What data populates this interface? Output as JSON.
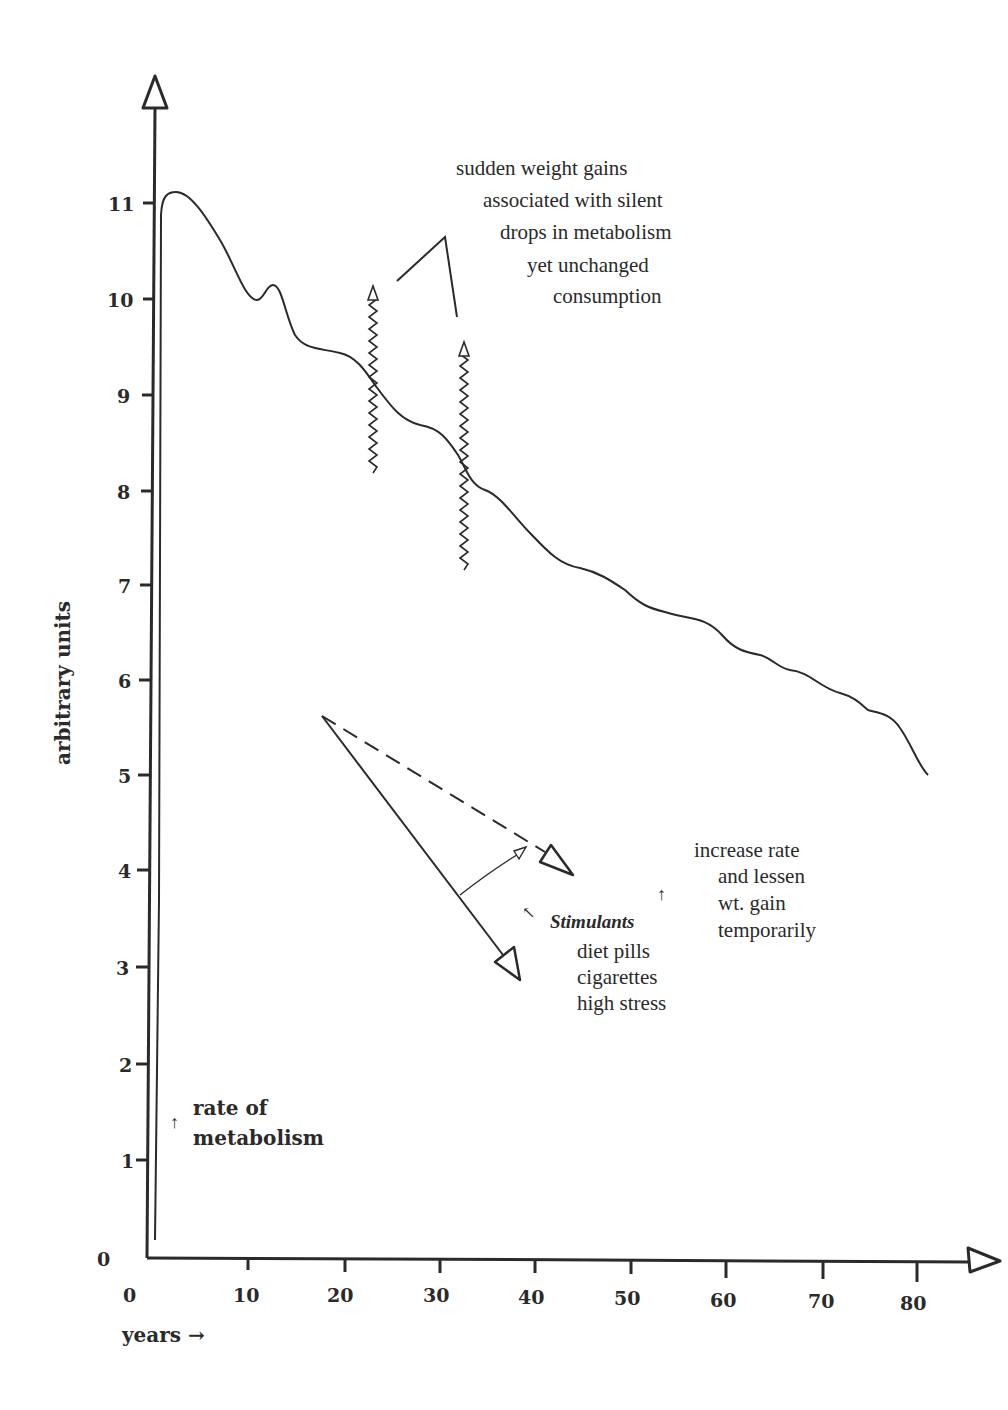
{
  "chart_data": {
    "type": "line",
    "title": "",
    "xlabel": "years →",
    "ylabel": "arbitrary units",
    "xlim": [
      0,
      85
    ],
    "ylim": [
      0,
      12
    ],
    "x_ticks": [
      "0",
      "10",
      "20",
      "30",
      "40",
      "50",
      "60",
      "70",
      "80"
    ],
    "y_ticks": [
      "0",
      "1",
      "2",
      "3",
      "4",
      "5",
      "6",
      "7",
      "8",
      "9",
      "10",
      "11"
    ],
    "grid": false,
    "legend": null,
    "series": [
      {
        "name": "rate of metabolism",
        "x": [
          1.5,
          1.6,
          3,
          5,
          8,
          11,
          12.5,
          14,
          16,
          20,
          22,
          25,
          27,
          29,
          31,
          33,
          35,
          38,
          40,
          44,
          46,
          50,
          53,
          56,
          58,
          60,
          62,
          64,
          67,
          70,
          72,
          74,
          81
        ],
        "values": [
          0.5,
          11.0,
          11.1,
          10.9,
          10.4,
          9.95,
          10.15,
          9.9,
          9.5,
          9.45,
          9.2,
          8.8,
          8.65,
          8.6,
          8.4,
          8.1,
          7.95,
          7.65,
          7.4,
          7.15,
          7.1,
          6.8,
          6.7,
          6.6,
          6.4,
          6.25,
          6.2,
          6.1,
          5.95,
          5.85,
          5.7,
          5.6,
          5.0
        ]
      }
    ],
    "annotations": [
      {
        "text": "sudden weight gains associated with silent drops in metabolism yet unchanged consumption",
        "points_to": "wavy up-arrows at ~22 and ~32 years"
      },
      {
        "text": "Stimulants: diet pills, cigarettes, high stress",
        "effect": "increase rate and lessen wt. gain temporarily"
      },
      {
        "text": "↑ rate of metabolism"
      }
    ]
  },
  "axes": {
    "y_label": "arbitrary units",
    "x_label": "years →",
    "y_tick_labels": [
      "0",
      "1",
      "2",
      "3",
      "4",
      "5",
      "6",
      "7",
      "8",
      "9",
      "10",
      "11"
    ],
    "x_tick_labels": [
      "0",
      "10",
      "20",
      "30",
      "40",
      "50",
      "60",
      "70",
      "80"
    ]
  },
  "annotations": {
    "weight_gain": {
      "lines": [
        "sudden weight gains",
        "associated with silent",
        "drops in metabolism",
        "yet unchanged",
        "consumption"
      ]
    },
    "stimulants": {
      "heading": "Stimulants",
      "items": [
        "diet pills",
        "cigarettes",
        "high stress"
      ],
      "heading_arrow": "↖"
    },
    "effect": {
      "arrow": "↑",
      "lines": [
        "increase rate",
        "and lessen",
        "wt. gain",
        "temporarily"
      ]
    },
    "legend": {
      "arrow": "↑",
      "lines": [
        "rate of",
        "metabolism"
      ]
    }
  },
  "colors": {
    "ink": "#2a2a2a",
    "background": "#ffffff"
  }
}
